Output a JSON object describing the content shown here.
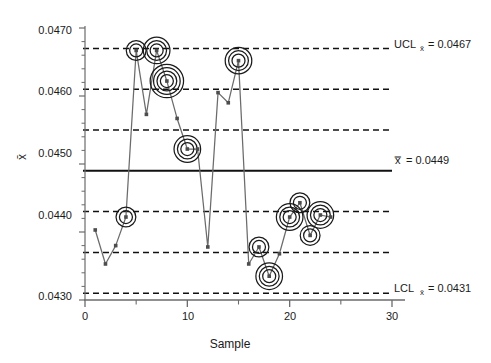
{
  "chart_data": {
    "type": "line",
    "title": "",
    "xlabel": "Sample",
    "ylabel": "x̄",
    "xlim": [
      0,
      30
    ],
    "ylim": [
      0.043,
      0.047
    ],
    "grid": false,
    "x_ticks": [
      0,
      10,
      20,
      30
    ],
    "x_tick_labels": [
      "0",
      "10",
      "20",
      "30"
    ],
    "y_ticks": [
      0.043,
      0.044,
      0.045,
      0.046,
      0.047
    ],
    "y_tick_labels": [
      "0.0430",
      "0.0440",
      "0.0450",
      "0.0460",
      "0.0470"
    ],
    "x": [
      1,
      2,
      3,
      4,
      5,
      6,
      7,
      8,
      9,
      10,
      11,
      12,
      13,
      14,
      15,
      16,
      17,
      18,
      19,
      20,
      21,
      22,
      23,
      24
    ],
    "values": [
      0.04403,
      0.04353,
      0.0438,
      0.04422,
      0.04667,
      0.04573,
      0.04667,
      0.04622,
      0.04567,
      0.04522,
      0.04522,
      0.04378,
      0.04605,
      0.0459,
      0.04652,
      0.04353,
      0.04378,
      0.04335,
      0.04368,
      0.04422,
      0.04443,
      0.04395,
      0.04425,
      0.04422
    ],
    "series": [
      {
        "name": "x-bar",
        "values": [
          0.04403,
          0.04353,
          0.0438,
          0.04422,
          0.04667,
          0.04573,
          0.04667,
          0.04622,
          0.04567,
          0.04522,
          0.04522,
          0.04378,
          0.04605,
          0.0459,
          0.04652,
          0.04353,
          0.04378,
          0.04335,
          0.04368,
          0.04422,
          0.04443,
          0.04395,
          0.04425,
          0.04422
        ]
      }
    ],
    "flagged_points": [
      {
        "sample": 4,
        "value": 0.04422,
        "rings": 1
      },
      {
        "sample": 5,
        "value": 0.04667,
        "rings": 1
      },
      {
        "sample": 7,
        "value": 0.04667,
        "rings": 2
      },
      {
        "sample": 8,
        "value": 0.04622,
        "rings": 3
      },
      {
        "sample": 10,
        "value": 0.04522,
        "rings": 2
      },
      {
        "sample": 15,
        "value": 0.04652,
        "rings": 2
      },
      {
        "sample": 17,
        "value": 0.04378,
        "rings": 1
      },
      {
        "sample": 18,
        "value": 0.04335,
        "rings": 2
      },
      {
        "sample": 20,
        "value": 0.04422,
        "rings": 2
      },
      {
        "sample": 21,
        "value": 0.04443,
        "rings": 1
      },
      {
        "sample": 22,
        "value": 0.04395,
        "rings": 1
      },
      {
        "sample": 23,
        "value": 0.04425,
        "rings": 2
      }
    ],
    "control_limits": {
      "ucl": {
        "value": 0.0467,
        "label_prefix": "UCL",
        "label_sub": "x̄",
        "label_value": "= 0.0467",
        "style": "dashed"
      },
      "center": {
        "value": 0.0449,
        "label_prefix": "",
        "label_sub": "x̿",
        "label_value": "= 0.0449",
        "style": "solid"
      },
      "lcl": {
        "value": 0.0431,
        "label_prefix": "LCL",
        "label_sub": "x̄",
        "label_value": "= 0.0431",
        "style": "dashed"
      }
    },
    "zone_lines": [
      {
        "value": 0.0467,
        "style": "dashed",
        "name": "ucl-3-sigma"
      },
      {
        "value": 0.0461,
        "style": "dashed",
        "name": "upper-2-sigma"
      },
      {
        "value": 0.0455,
        "style": "dashed",
        "name": "upper-1-sigma"
      },
      {
        "value": 0.0449,
        "style": "solid",
        "name": "center-line"
      },
      {
        "value": 0.0443,
        "style": "dashed",
        "name": "lower-1-sigma"
      },
      {
        "value": 0.0437,
        "style": "dashed",
        "name": "lower-2-sigma"
      },
      {
        "value": 0.0431,
        "style": "dashed",
        "name": "lcl-3-sigma"
      }
    ],
    "colors": {
      "line": "#6b6b6b",
      "marker": "#4d4d4d",
      "ring": "#1a1a1a",
      "axis": "#6b6b6b",
      "limit": "#111111",
      "text": "#1a1a1a",
      "background": "#ffffff"
    }
  },
  "labels": {
    "ucl_text": "UCL",
    "ucl_sub": "x̄",
    "ucl_eq": "= 0.0467",
    "center_sub": "x̿",
    "center_eq": "= 0.0449",
    "lcl_text": "LCL",
    "lcl_sub": "x̄",
    "lcl_eq": "= 0.0431",
    "x_axis_title": "Sample",
    "y_axis_title": "x̄",
    "ytick_0": "0.0470",
    "ytick_1": "0.0460",
    "ytick_2": "0.0450",
    "ytick_3": "0.0440",
    "ytick_4": "0.0430",
    "xtick_0": "0",
    "xtick_1": "10",
    "xtick_2": "20",
    "xtick_3": "30"
  }
}
